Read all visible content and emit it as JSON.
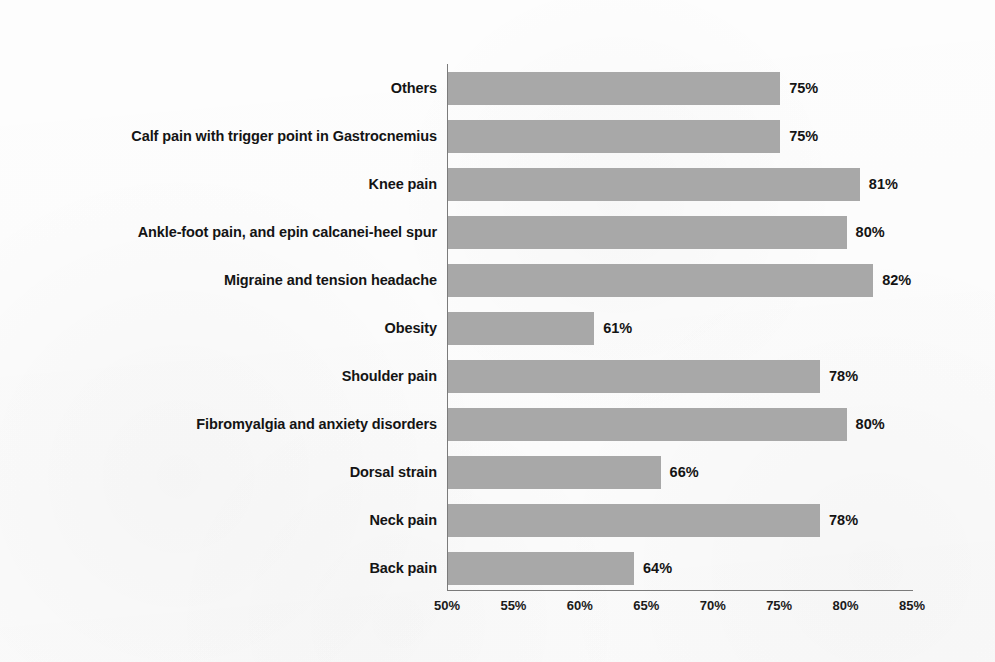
{
  "chart_data": {
    "type": "bar",
    "orientation": "horizontal",
    "title": "",
    "xlabel": "",
    "ylabel": "",
    "xlim": [
      50,
      85
    ],
    "xtick_labels": [
      "50%",
      "55%",
      "60%",
      "65%",
      "70%",
      "75%",
      "80%",
      "85%"
    ],
    "xticks": [
      50,
      55,
      60,
      65,
      70,
      75,
      80,
      85
    ],
    "grid": false,
    "legend": false,
    "value_suffix": "%",
    "bar_color": "#a8a8a8",
    "axis_color": "#7b7b7b",
    "text_color": "#141414",
    "background_color": "#fefefe",
    "categories": [
      "Others",
      "Calf pain with trigger point in Gastrocnemius",
      "Knee pain",
      "Ankle-foot pain, and epin calcanei-heel spur",
      "Migraine and tension headache",
      "Obesity",
      "Shoulder pain",
      "Fibromyalgia and anxiety disorders",
      "Dorsal strain",
      "Neck pain",
      "Back pain"
    ],
    "values": [
      75,
      75,
      81,
      80,
      82,
      61,
      78,
      80,
      66,
      78,
      64
    ],
    "value_labels": [
      "75%",
      "75%",
      "81%",
      "80%",
      "82%",
      "61%",
      "78%",
      "80%",
      "66%",
      "78%",
      "64%"
    ]
  }
}
